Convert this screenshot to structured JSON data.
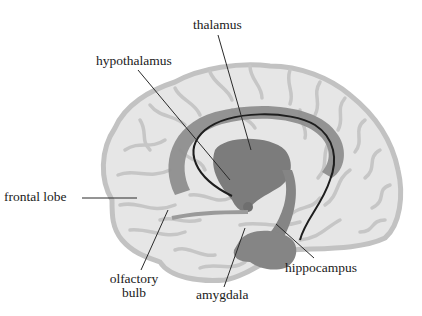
{
  "diagram": {
    "colors": {
      "background": "#ffffff",
      "cortex_fill": "#e6e6e6",
      "cortex_outline": "#c2c2c2",
      "sulci": "#c4c4c4",
      "limbic": "#8e8e8e",
      "limbic_dark": "#7a7a7a",
      "fornix_line": "#1e1e1e",
      "leader_line": "#2a2a2a",
      "text": "#1a1a1a"
    },
    "labels": {
      "thalamus": "thalamus",
      "hypothalamus": "hypothalamus",
      "frontal_lobe": "frontal lobe",
      "olfactory_bulb_line1": "olfactory",
      "olfactory_bulb_line2": "bulb",
      "amygdala": "amygdala",
      "hippocampus": "hippocampus"
    }
  }
}
